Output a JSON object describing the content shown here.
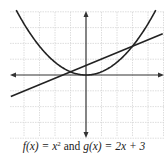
{
  "figure": {
    "caption": {
      "f_label": "f(x) = x",
      "f_exponent": "2",
      "connector": "and",
      "g_label": "g(x) = 2x + 3"
    },
    "colors": {
      "curve": "#222222",
      "axis": "#333333",
      "grid": "#d6d6d6",
      "background": "#ffffff"
    }
  },
  "chart_data": {
    "type": "line",
    "title": "",
    "xlabel": "x",
    "ylabel": "y",
    "grid": true,
    "series": [
      {
        "name": "f(x) = x^2",
        "kind": "parabola",
        "x_range": [
          -4.5,
          4.5
        ]
      },
      {
        "name": "g(x) = 2x + 3",
        "kind": "line",
        "x_range": [
          -4.85,
          4.95
        ]
      }
    ],
    "intersections": [
      {
        "x": -1,
        "y": 1
      },
      {
        "x": 3,
        "y": 9
      }
    ],
    "axes": {
      "origin_px": [
        86,
        75
      ],
      "x_px_per_unit": 15.5,
      "y_px_per_unit": 3.2,
      "x_grid_step": 1,
      "y_grid_step": 5
    },
    "xlim": [
      -4.9,
      5.0
    ],
    "ylim": [
      -20,
      20
    ]
  }
}
